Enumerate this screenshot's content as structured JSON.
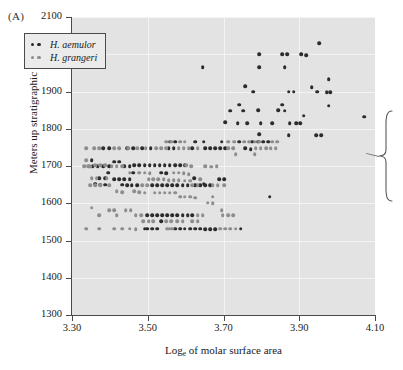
{
  "figure": {
    "panel_label": "(A)",
    "background_color": "#e3e3e3",
    "gridline_color": "#f4f4f4",
    "axis_color": "#4a4a4a"
  },
  "legend": {
    "position": "top-left-inside",
    "entries": [
      {
        "label": "H. aemulor",
        "color": "#2b2b2b",
        "dot_count": 2
      },
      {
        "label": "H. grangeri",
        "color": "#8d8d8d",
        "dot_count": 2
      }
    ]
  },
  "callout": {
    "name": "bracket-annotation",
    "shape": "curly-brace-with-pointer",
    "color": "#5a5a5a"
  },
  "chart_data": {
    "type": "scatter",
    "title": "",
    "xlabel": "Logₑ of molar surface area",
    "xlabel_base": "Log",
    "xlabel_sub": "e",
    "xlabel_rest": " of molar surface area",
    "ylabel": "Meters up stratigraphic section",
    "xlim": [
      3.3,
      4.1
    ],
    "ylim": [
      1300,
      2100
    ],
    "xticks": [
      3.3,
      3.5,
      3.7,
      3.9,
      4.1
    ],
    "xtick_labels": [
      "3.30",
      "3.50",
      "3.70",
      "3.90",
      "4.10"
    ],
    "yticks": [
      1300,
      1400,
      1500,
      1600,
      1700,
      1800,
      1900,
      2000,
      2100
    ],
    "ytick_labels": [
      "1300",
      "1400",
      "1500",
      "1600",
      "1700",
      "1800",
      "1900",
      "2000",
      "2100"
    ],
    "grid": true,
    "grid_color": "#f4f4f4",
    "marker_size_px": 3.6,
    "legend_position": "upper left",
    "series": [
      {
        "name": "H. aemulor",
        "color": "#2b2b2b",
        "points": [
          [
            3.645,
            1965
          ],
          [
            3.795,
            2000
          ],
          [
            3.855,
            2000
          ],
          [
            3.868,
            2000
          ],
          [
            3.905,
            2000
          ],
          [
            3.918,
            1998
          ],
          [
            3.952,
            2030
          ],
          [
            3.795,
            1965
          ],
          [
            3.862,
            1965
          ],
          [
            3.758,
            1915
          ],
          [
            3.933,
            1912
          ],
          [
            3.978,
            1933
          ],
          [
            3.778,
            1900
          ],
          [
            3.872,
            1900
          ],
          [
            3.885,
            1900
          ],
          [
            3.948,
            1900
          ],
          [
            3.972,
            1898
          ],
          [
            3.982,
            1898
          ],
          [
            3.742,
            1865
          ],
          [
            3.855,
            1865
          ],
          [
            3.845,
            1850
          ],
          [
            3.862,
            1848
          ],
          [
            3.978,
            1862
          ],
          [
            3.718,
            1848
          ],
          [
            3.752,
            1848
          ],
          [
            3.792,
            1850
          ],
          [
            3.912,
            1835
          ],
          [
            4.072,
            1832
          ],
          [
            3.705,
            1818
          ],
          [
            3.738,
            1815
          ],
          [
            3.762,
            1815
          ],
          [
            3.798,
            1815
          ],
          [
            3.828,
            1815
          ],
          [
            3.875,
            1815
          ],
          [
            3.892,
            1815
          ],
          [
            3.902,
            1815
          ],
          [
            3.795,
            1785
          ],
          [
            3.872,
            1782
          ],
          [
            3.945,
            1782
          ],
          [
            3.958,
            1782
          ],
          [
            3.558,
            1765
          ],
          [
            3.572,
            1765
          ],
          [
            3.625,
            1765
          ],
          [
            3.648,
            1765
          ],
          [
            3.695,
            1765
          ],
          [
            3.742,
            1765
          ],
          [
            3.775,
            1765
          ],
          [
            3.792,
            1765
          ],
          [
            3.805,
            1765
          ],
          [
            3.818,
            1765
          ],
          [
            3.758,
            1748
          ],
          [
            3.772,
            1745
          ],
          [
            3.555,
            1748
          ],
          [
            3.568,
            1748
          ],
          [
            3.508,
            1748
          ],
          [
            3.485,
            1748
          ],
          [
            3.462,
            1748
          ],
          [
            3.445,
            1748
          ],
          [
            3.398,
            1748
          ],
          [
            3.382,
            1748
          ],
          [
            3.618,
            1748
          ],
          [
            3.652,
            1748
          ],
          [
            3.665,
            1748
          ],
          [
            3.678,
            1748
          ],
          [
            3.692,
            1748
          ],
          [
            3.705,
            1748
          ],
          [
            3.412,
            1712
          ],
          [
            3.425,
            1712
          ],
          [
            3.352,
            1715
          ],
          [
            3.465,
            1702
          ],
          [
            3.478,
            1702
          ],
          [
            3.492,
            1702
          ],
          [
            3.505,
            1702
          ],
          [
            3.518,
            1702
          ],
          [
            3.532,
            1702
          ],
          [
            3.545,
            1702
          ],
          [
            3.558,
            1702
          ],
          [
            3.572,
            1702
          ],
          [
            3.585,
            1702
          ],
          [
            3.598,
            1702
          ],
          [
            3.438,
            1700
          ],
          [
            3.452,
            1700
          ],
          [
            3.398,
            1700
          ],
          [
            3.382,
            1700
          ],
          [
            3.368,
            1700
          ],
          [
            3.355,
            1700
          ],
          [
            3.395,
            1682
          ],
          [
            3.535,
            1682
          ],
          [
            3.548,
            1680
          ],
          [
            3.462,
            1682
          ],
          [
            3.412,
            1665
          ],
          [
            3.425,
            1665
          ],
          [
            3.438,
            1665
          ],
          [
            3.452,
            1665
          ],
          [
            3.372,
            1668
          ],
          [
            3.388,
            1668
          ],
          [
            3.622,
            1668
          ],
          [
            3.688,
            1665
          ],
          [
            3.702,
            1665
          ],
          [
            3.648,
            1652
          ],
          [
            3.512,
            1648
          ],
          [
            3.525,
            1648
          ],
          [
            3.538,
            1648
          ],
          [
            3.552,
            1648
          ],
          [
            3.565,
            1648
          ],
          [
            3.578,
            1648
          ],
          [
            3.592,
            1648
          ],
          [
            3.605,
            1648
          ],
          [
            3.472,
            1648
          ],
          [
            3.458,
            1648
          ],
          [
            3.445,
            1648
          ],
          [
            3.432,
            1650
          ],
          [
            3.388,
            1650
          ],
          [
            3.375,
            1650
          ],
          [
            3.362,
            1652
          ],
          [
            3.625,
            1648
          ],
          [
            3.638,
            1648
          ],
          [
            3.652,
            1648
          ],
          [
            3.665,
            1648
          ],
          [
            3.498,
            1568
          ],
          [
            3.512,
            1568
          ],
          [
            3.525,
            1568
          ],
          [
            3.538,
            1568
          ],
          [
            3.552,
            1568
          ],
          [
            3.565,
            1568
          ],
          [
            3.578,
            1568
          ],
          [
            3.592,
            1568
          ],
          [
            3.605,
            1568
          ],
          [
            3.618,
            1568
          ],
          [
            3.535,
            1552
          ],
          [
            3.498,
            1532
          ],
          [
            3.512,
            1532
          ],
          [
            3.525,
            1532
          ],
          [
            3.492,
            1532
          ],
          [
            3.598,
            1532
          ],
          [
            3.612,
            1532
          ],
          [
            3.625,
            1532
          ],
          [
            3.638,
            1532
          ],
          [
            3.652,
            1530
          ],
          [
            3.665,
            1530
          ],
          [
            3.678,
            1530
          ],
          [
            3.745,
            1532
          ],
          [
            3.585,
            1532
          ],
          [
            3.572,
            1532
          ],
          [
            3.822,
            1618
          ]
        ]
      },
      {
        "name": "H. grangeri",
        "color": "#8d8d8d",
        "points": [
          [
            3.338,
            1748
          ],
          [
            3.358,
            1748
          ],
          [
            3.372,
            1748
          ],
          [
            3.412,
            1748
          ],
          [
            3.425,
            1748
          ],
          [
            3.448,
            1748
          ],
          [
            3.472,
            1748
          ],
          [
            3.495,
            1748
          ],
          [
            3.522,
            1748
          ],
          [
            3.535,
            1748
          ],
          [
            3.548,
            1748
          ],
          [
            3.582,
            1748
          ],
          [
            3.595,
            1748
          ],
          [
            3.608,
            1748
          ],
          [
            3.632,
            1748
          ],
          [
            3.712,
            1748
          ],
          [
            3.725,
            1748
          ],
          [
            3.785,
            1748
          ],
          [
            3.798,
            1748
          ],
          [
            3.812,
            1748
          ],
          [
            3.825,
            1748
          ],
          [
            3.838,
            1748
          ],
          [
            3.548,
            1765
          ],
          [
            3.562,
            1765
          ],
          [
            3.585,
            1765
          ],
          [
            3.598,
            1765
          ],
          [
            3.712,
            1765
          ],
          [
            3.728,
            1765
          ],
          [
            3.755,
            1765
          ],
          [
            3.768,
            1765
          ],
          [
            3.782,
            1765
          ],
          [
            3.795,
            1765
          ],
          [
            3.828,
            1765
          ],
          [
            3.842,
            1765
          ],
          [
            3.732,
            1732
          ],
          [
            3.782,
            1732
          ],
          [
            3.332,
            1700
          ],
          [
            3.342,
            1700
          ],
          [
            3.348,
            1698
          ],
          [
            3.338,
            1715
          ],
          [
            3.362,
            1702
          ],
          [
            3.375,
            1702
          ],
          [
            3.388,
            1702
          ],
          [
            3.405,
            1700
          ],
          [
            3.418,
            1700
          ],
          [
            3.432,
            1700
          ],
          [
            3.602,
            1702
          ],
          [
            3.615,
            1700
          ],
          [
            3.652,
            1700
          ],
          [
            3.668,
            1698
          ],
          [
            3.682,
            1700
          ],
          [
            3.392,
            1668
          ],
          [
            3.352,
            1668
          ],
          [
            3.365,
            1668
          ],
          [
            3.452,
            1682
          ],
          [
            3.478,
            1682
          ],
          [
            3.492,
            1682
          ],
          [
            3.505,
            1680
          ],
          [
            3.568,
            1682
          ],
          [
            3.582,
            1682
          ],
          [
            3.595,
            1680
          ],
          [
            3.608,
            1678
          ],
          [
            3.502,
            1665
          ],
          [
            3.515,
            1665
          ],
          [
            3.528,
            1665
          ],
          [
            3.542,
            1665
          ],
          [
            3.555,
            1662
          ],
          [
            3.568,
            1662
          ],
          [
            3.582,
            1662
          ],
          [
            3.598,
            1660
          ],
          [
            3.612,
            1660
          ],
          [
            3.638,
            1665
          ],
          [
            3.348,
            1648
          ],
          [
            3.362,
            1648
          ],
          [
            3.375,
            1648
          ],
          [
            3.398,
            1648
          ],
          [
            3.485,
            1648
          ],
          [
            3.498,
            1648
          ],
          [
            3.618,
            1648
          ],
          [
            3.632,
            1648
          ],
          [
            3.672,
            1648
          ],
          [
            3.685,
            1648
          ],
          [
            3.418,
            1632
          ],
          [
            3.432,
            1630
          ],
          [
            3.465,
            1632
          ],
          [
            3.478,
            1630
          ],
          [
            3.492,
            1628
          ],
          [
            3.518,
            1628
          ],
          [
            3.532,
            1628
          ],
          [
            3.545,
            1628
          ],
          [
            3.558,
            1628
          ],
          [
            3.572,
            1628
          ],
          [
            3.598,
            1618
          ],
          [
            3.612,
            1618
          ],
          [
            3.625,
            1615
          ],
          [
            3.658,
            1602
          ],
          [
            3.672,
            1600
          ],
          [
            3.352,
            1588
          ],
          [
            3.398,
            1582
          ],
          [
            3.412,
            1582
          ],
          [
            3.442,
            1582
          ],
          [
            3.455,
            1582
          ],
          [
            3.372,
            1568
          ],
          [
            3.418,
            1568
          ],
          [
            3.468,
            1568
          ],
          [
            3.482,
            1568
          ],
          [
            3.632,
            1568
          ],
          [
            3.645,
            1568
          ],
          [
            3.698,
            1568
          ],
          [
            3.712,
            1568
          ],
          [
            3.725,
            1568
          ],
          [
            3.488,
            1552
          ],
          [
            3.502,
            1552
          ],
          [
            3.515,
            1552
          ],
          [
            3.548,
            1552
          ],
          [
            3.562,
            1552
          ],
          [
            3.578,
            1552
          ],
          [
            3.592,
            1552
          ],
          [
            3.618,
            1552
          ],
          [
            3.632,
            1552
          ],
          [
            3.338,
            1532
          ],
          [
            3.372,
            1532
          ],
          [
            3.412,
            1532
          ],
          [
            3.432,
            1532
          ],
          [
            3.452,
            1532
          ],
          [
            3.468,
            1530
          ],
          [
            3.552,
            1532
          ],
          [
            3.565,
            1532
          ],
          [
            3.692,
            1532
          ],
          [
            3.705,
            1532
          ],
          [
            3.718,
            1532
          ],
          [
            3.732,
            1532
          ],
          [
            3.695,
            1582
          ],
          [
            3.558,
            1532
          ],
          [
            3.345,
            1700
          ],
          [
            3.672,
            1618
          ],
          [
            3.585,
            1618
          ],
          [
            3.702,
            1648
          ]
        ]
      }
    ]
  }
}
